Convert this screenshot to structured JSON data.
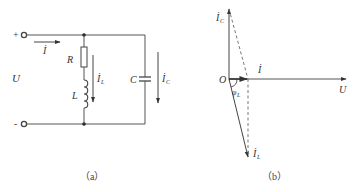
{
  "figure": {
    "panel_a": {
      "caption": "（a）",
      "terminals": {
        "plus": "+",
        "minus": "-"
      },
      "labels": {
        "source_voltage": "U",
        "total_current": "İ",
        "resistor": "R",
        "inductor": "L",
        "capacitor": "C",
        "inductor_current": "İ",
        "inductor_current_sub": "L",
        "capacitor_current": "İ",
        "capacitor_current_sub": "C"
      }
    },
    "panel_b": {
      "caption": "（b）",
      "labels": {
        "origin": "O",
        "voltage_phasor": "U",
        "total_current_phasor": "İ",
        "capacitor_current_phasor": "İ",
        "capacitor_current_sub": "C",
        "inductor_current_phasor": "İ",
        "inductor_current_sub": "L",
        "phase_angle": "φ",
        "phase_angle_sub": "L"
      }
    }
  },
  "colors": {
    "line": "#555555",
    "text": "#333333",
    "background": "#ffffff"
  }
}
